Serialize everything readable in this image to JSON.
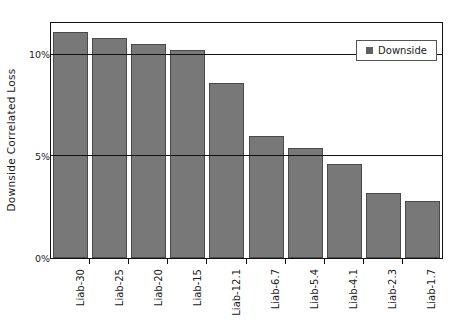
{
  "chart_data": {
    "type": "bar",
    "title": "",
    "xlabel": "",
    "ylabel": "Downside Correlated Loss",
    "categories": [
      "Liab-30",
      "Liab-25",
      "Liab-20",
      "Liab-15",
      "Liab-12.1",
      "Liab-6.7",
      "Liab-5.4",
      "Liab-4.1",
      "Liab-2.3",
      "Liab-1.7"
    ],
    "series": [
      {
        "name": "Downside",
        "values": [
          11.1,
          10.8,
          10.5,
          10.2,
          8.6,
          6.0,
          5.4,
          4.6,
          3.2,
          2.8
        ],
        "color": "#787878"
      }
    ],
    "ylim": [
      0,
      11.5
    ],
    "ytick_values": [
      0,
      5,
      10
    ],
    "ytick_labels": [
      "0%",
      "5%",
      "10%"
    ],
    "grid": true,
    "grid_axis": "y",
    "legend": [
      "Downside"
    ],
    "legend_position": "top-right",
    "value_unit": "%"
  },
  "legend": {
    "entries": [
      {
        "label": "Downside",
        "swatch_color": "#606060"
      }
    ]
  },
  "colors": {
    "bar_fill": "#787878",
    "bar_edge": "#4a4a4a",
    "axis": "#111111",
    "text": "#1a1a1a",
    "background": "#ffffff"
  }
}
